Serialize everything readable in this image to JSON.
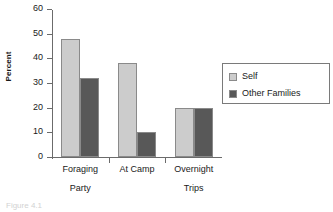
{
  "chart_data": {
    "type": "bar",
    "title": "",
    "xlabel": "",
    "ylabel": "Percent",
    "ylim": [
      0,
      60
    ],
    "ytick_step": 10,
    "yticks": [
      60,
      50,
      40,
      30,
      20,
      10,
      0
    ],
    "grid": false,
    "legend_position": "right",
    "categories": [
      "Foraging Party",
      "At Camp",
      "Overnight Trips"
    ],
    "category_lines": [
      {
        "line1": "Foraging",
        "line2": "Party"
      },
      {
        "line1": "At Camp",
        "line2": ""
      },
      {
        "line1": "Overnight",
        "line2": "Trips"
      }
    ],
    "series": [
      {
        "name": "Self",
        "color": "#cccccc",
        "values": [
          48,
          38,
          20
        ]
      },
      {
        "name": "Other Families",
        "color": "#585858",
        "values": [
          32,
          10,
          20
        ]
      }
    ]
  },
  "legend": {
    "items": [
      {
        "label": "Self",
        "color": "#cccccc"
      },
      {
        "label": "Other Families",
        "color": "#585858"
      }
    ]
  },
  "axis": {
    "y_title": "Percent",
    "y_tick_labels": [
      "60",
      "50",
      "40",
      "30",
      "20",
      "10",
      "0"
    ]
  },
  "caption": {
    "text": "Figure 4.1"
  },
  "colors": {
    "series_self": "#cccccc",
    "series_other": "#585858",
    "bar_border": "#8a8a8a",
    "axis": "#6b6b6b",
    "text": "#1a1a1a",
    "background": "#ffffff"
  }
}
